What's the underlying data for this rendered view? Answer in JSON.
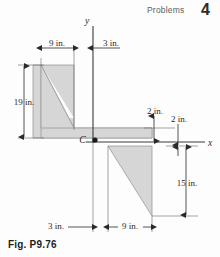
{
  "header": {
    "running_head": "Problems",
    "page_number": "4"
  },
  "figure": {
    "caption": "Fig. P9.76",
    "axes": {
      "y_label": "y",
      "x_label": "x"
    },
    "centroid_label": "C",
    "dimensions": {
      "left_width": "9 in.",
      "top_gap": "3 in.",
      "left_height": "19 in.",
      "upper_thickness": "2 in.",
      "lower_thickness": "2 in.",
      "right_depth": "15 in.",
      "bottom_left": "3 in.",
      "bottom_right": "9 in."
    },
    "colors": {
      "fill": "#d6d6d6",
      "outline": "#9a9a9a",
      "line": "#3a3a3a"
    }
  }
}
